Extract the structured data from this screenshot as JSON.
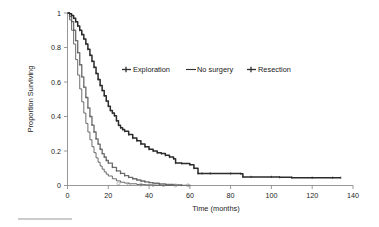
{
  "chart_data": {
    "type": "line",
    "title": "",
    "xlabel": "Time (months)",
    "ylabel": "Proportion Surviving",
    "xlim": [
      0,
      140
    ],
    "ylim": [
      0,
      1
    ],
    "xticks": [
      0,
      20,
      40,
      60,
      80,
      100,
      120,
      140
    ],
    "yticks": [
      0,
      0.2,
      0.4,
      0.6,
      0.8,
      1
    ],
    "xtick_labels": [
      "0",
      "20",
      "40",
      "60",
      "80",
      "100",
      "120",
      "140"
    ],
    "ytick_labels": [
      "0",
      "0.2",
      "0.4",
      "0.6",
      "0.8",
      "1"
    ],
    "grid": false,
    "legend_position": "upper-center",
    "series": [
      {
        "name": "Exploration",
        "style": "line-with-censor-marks",
        "color": "#6f6f6f",
        "x": [
          0,
          1,
          2,
          3,
          4,
          5,
          6,
          7,
          8,
          9,
          10,
          11,
          12,
          13,
          14,
          15,
          16,
          17,
          18,
          19,
          20,
          22,
          24,
          26,
          28,
          30,
          32,
          34,
          36,
          38,
          40,
          42,
          45,
          48,
          52,
          56,
          60
        ],
        "y": [
          1.0,
          0.98,
          0.95,
          0.9,
          0.84,
          0.77,
          0.7,
          0.63,
          0.57,
          0.51,
          0.45,
          0.4,
          0.35,
          0.31,
          0.27,
          0.24,
          0.21,
          0.185,
          0.165,
          0.145,
          0.13,
          0.105,
          0.085,
          0.07,
          0.057,
          0.047,
          0.039,
          0.032,
          0.026,
          0.021,
          0.017,
          0.013,
          0.009,
          0.006,
          0.003,
          0.001,
          0.0
        ]
      },
      {
        "name": "No surgery",
        "style": "thin-line",
        "color": "#3d3d3d",
        "x": [
          0,
          1,
          2,
          3,
          4,
          5,
          6,
          7,
          8,
          9,
          10,
          11,
          12,
          13,
          14,
          15,
          16,
          17,
          18,
          19,
          20,
          22,
          24,
          26,
          28,
          30,
          34,
          38,
          42,
          46,
          50,
          55,
          60
        ],
        "y": [
          1.0,
          0.96,
          0.9,
          0.82,
          0.73,
          0.64,
          0.56,
          0.485,
          0.42,
          0.36,
          0.31,
          0.265,
          0.225,
          0.19,
          0.16,
          0.135,
          0.113,
          0.095,
          0.079,
          0.066,
          0.055,
          0.039,
          0.027,
          0.019,
          0.014,
          0.01,
          0.006,
          0.004,
          0.002,
          0.001,
          0.001,
          0.0,
          0.0
        ]
      },
      {
        "name": "Resection",
        "style": "thick-line-with-censor-marks",
        "color": "#2b2b2b",
        "x": [
          0,
          1,
          2,
          3,
          4,
          5,
          6,
          7,
          8,
          9,
          10,
          11,
          12,
          13,
          14,
          15,
          16,
          17,
          18,
          19,
          20,
          21,
          22,
          23,
          24,
          25,
          26,
          27,
          28,
          30,
          32,
          34,
          36,
          38,
          40,
          42,
          44,
          46,
          48,
          50,
          52,
          53,
          56,
          60,
          62,
          64,
          66,
          70,
          80,
          85,
          86,
          90,
          100,
          104,
          110,
          120,
          130,
          134
        ],
        "y": [
          1.0,
          0.995,
          0.985,
          0.97,
          0.95,
          0.925,
          0.9,
          0.875,
          0.85,
          0.82,
          0.79,
          0.755,
          0.72,
          0.685,
          0.65,
          0.615,
          0.58,
          0.55,
          0.52,
          0.49,
          0.46,
          0.435,
          0.42,
          0.405,
          0.375,
          0.35,
          0.335,
          0.325,
          0.315,
          0.295,
          0.275,
          0.26,
          0.24,
          0.225,
          0.21,
          0.2,
          0.19,
          0.185,
          0.175,
          0.165,
          0.155,
          0.13,
          0.128,
          0.12,
          0.1,
          0.07,
          0.07,
          0.07,
          0.07,
          0.068,
          0.05,
          0.05,
          0.05,
          0.048,
          0.045,
          0.045,
          0.045,
          0.045
        ]
      }
    ]
  },
  "legend": {
    "items": [
      {
        "label": "Exploration",
        "marker": "cross-line",
        "color": "#6f6f6f"
      },
      {
        "label": "No surgery",
        "marker": "line",
        "color": "#2f2f2f"
      },
      {
        "label": "Resection",
        "marker": "cross-line",
        "color": "#2f2f2f"
      }
    ]
  },
  "axes": {
    "y_title": "Proportion Surviving",
    "x_title": "Time (months)"
  }
}
